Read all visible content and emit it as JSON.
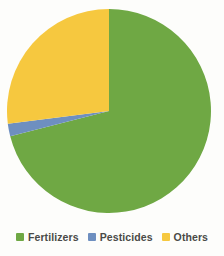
{
  "chart_data": {
    "type": "pie",
    "title": "",
    "subtitle": "",
    "categories": [
      "Fertilizers",
      "Pesticides",
      "Others"
    ],
    "values": [
      71,
      2,
      27
    ],
    "unit": "%",
    "colors": [
      "#6fa844",
      "#6e8fc0",
      "#f6c83f"
    ],
    "start_angle_deg": 0,
    "direction": "clockwise",
    "grid": false,
    "legend_position": "bottom",
    "data_labels_shown": false,
    "annotations": [],
    "slices": [
      {
        "label": "Fertilizers",
        "value": 71,
        "color": "#6fa844",
        "start_deg": 0,
        "sweep_deg": 255.6
      },
      {
        "label": "Pesticides",
        "value": 2,
        "color": "#6e8fc0",
        "start_deg": 255.6,
        "sweep_deg": 7.2
      },
      {
        "label": "Others",
        "value": 27,
        "color": "#f6c83f",
        "start_deg": 262.8,
        "sweep_deg": 97.2
      }
    ],
    "geometry": {
      "cx": 109,
      "cy": 111,
      "r": 102
    }
  },
  "legend": {
    "items": [
      {
        "label": "Fertilizers",
        "color": "#6fa844"
      },
      {
        "label": "Pesticides",
        "color": "#6e8fc0"
      },
      {
        "label": "Others",
        "color": "#f6c83f"
      }
    ]
  },
  "background_color": "#fdfdfb"
}
